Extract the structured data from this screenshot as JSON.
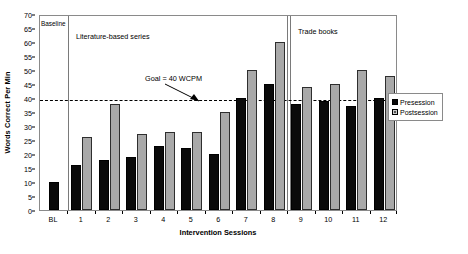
{
  "chart_data": {
    "type": "bar",
    "title": "",
    "xlabel": "Intervention Sessions",
    "ylabel": "Words Correct Per Min",
    "ylim": [
      0,
      70
    ],
    "ytick_step": 5,
    "yticks": [
      0,
      5,
      10,
      15,
      20,
      25,
      30,
      35,
      40,
      45,
      50,
      55,
      60,
      65,
      70
    ],
    "grid": false,
    "legend_position": "right",
    "categories": [
      "BL",
      "1",
      "2",
      "3",
      "4",
      "5",
      "6",
      "7",
      "8",
      "9",
      "10",
      "11",
      "12"
    ],
    "series": [
      {
        "name": "Presession",
        "color": "#0a0a0a",
        "values": [
          10,
          16,
          18,
          19,
          23,
          22,
          20,
          40,
          45,
          38,
          39,
          37,
          40
        ]
      },
      {
        "name": "Postsession",
        "color": "#a9a9a9",
        "values": [
          null,
          26,
          38,
          27,
          28,
          28,
          35,
          50,
          60,
          44,
          45,
          50,
          48
        ]
      }
    ],
    "reference_lines": [
      {
        "label": "Goal = 40 WCPM",
        "value": 40,
        "style": "dashed",
        "orientation": "horizontal"
      }
    ],
    "phases": [
      {
        "label": "Baseline",
        "categories": [
          "BL"
        ]
      },
      {
        "label": "Literature-based series",
        "categories": [
          "1",
          "2",
          "3",
          "4",
          "5",
          "6",
          "7",
          "8"
        ]
      },
      {
        "label": "Trade books",
        "categories": [
          "9",
          "10",
          "11",
          "12"
        ]
      }
    ]
  },
  "legend": {
    "items": [
      {
        "label": "Presession"
      },
      {
        "label": "Postsession"
      }
    ]
  },
  "annotations": {
    "goal_text": "Goal = 40 WCPM",
    "baseline_text": "Baseline",
    "literature_text": "Literature-based series",
    "trade_text": "Trade books"
  }
}
